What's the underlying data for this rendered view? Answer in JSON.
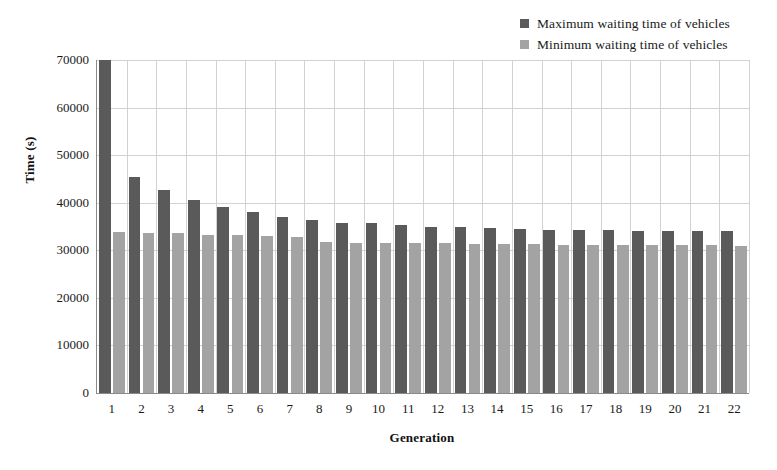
{
  "chart_data": {
    "type": "bar",
    "title": "",
    "xlabel": "Generation",
    "ylabel": "Time (s)",
    "categories": [
      "1",
      "2",
      "3",
      "4",
      "5",
      "6",
      "7",
      "8",
      "9",
      "10",
      "11",
      "12",
      "13",
      "14",
      "15",
      "16",
      "17",
      "18",
      "19",
      "20",
      "21",
      "22"
    ],
    "series": [
      {
        "name": "Maximum waiting time of vehicles",
        "color": "#5a5a5a",
        "values": [
          70000,
          45500,
          42700,
          40500,
          39200,
          38100,
          37000,
          36300,
          35800,
          35800,
          35300,
          35000,
          34800,
          34700,
          34400,
          34300,
          34200,
          34200,
          34100,
          34100,
          34000,
          34000
        ]
      },
      {
        "name": "Minimum waiting time of vehicles",
        "color": "#a3a3a3",
        "values": [
          33800,
          33700,
          33600,
          33300,
          33200,
          33100,
          32900,
          31700,
          31600,
          31600,
          31500,
          31500,
          31400,
          31400,
          31300,
          31200,
          31200,
          31200,
          31100,
          31100,
          31100,
          31000
        ]
      }
    ],
    "ylim": [
      0,
      70000
    ],
    "yticks": [
      0,
      10000,
      20000,
      30000,
      40000,
      50000,
      60000,
      70000
    ],
    "ytick_labels": [
      "0",
      "10000",
      "20000",
      "30000",
      "40000",
      "50000",
      "60000",
      "70000"
    ],
    "grid": "horizontal-and-vertical",
    "legend_position": "top-right"
  },
  "legend": {
    "items": [
      {
        "label": "Maximum waiting time of vehicles",
        "color": "#5a5a5a"
      },
      {
        "label": "Minimum waiting time of vehicles",
        "color": "#a3a3a3"
      }
    ]
  }
}
